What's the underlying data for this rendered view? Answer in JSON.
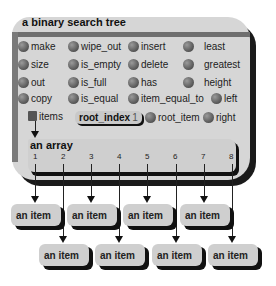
{
  "object": {
    "title": "a binary search tree",
    "features": [
      {
        "label": "make",
        "col": 0,
        "row": 0
      },
      {
        "label": "wipe_out",
        "col": 1,
        "row": 0
      },
      {
        "label": "insert",
        "col": 2,
        "row": 0
      },
      {
        "label": "least",
        "col": 3,
        "row": 0
      },
      {
        "label": "size",
        "col": 0,
        "row": 1
      },
      {
        "label": "is_empty",
        "col": 1,
        "row": 1
      },
      {
        "label": "delete",
        "col": 2,
        "row": 1
      },
      {
        "label": "greatest",
        "col": 3,
        "row": 1
      },
      {
        "label": "out",
        "col": 0,
        "row": 2
      },
      {
        "label": "is_full",
        "col": 1,
        "row": 2
      },
      {
        "label": "has",
        "col": 2,
        "row": 2
      },
      {
        "label": "height",
        "col": 3,
        "row": 2
      },
      {
        "label": "copy",
        "col": 0,
        "row": 3
      },
      {
        "label": "is_equal",
        "col": 1,
        "row": 3
      },
      {
        "label": "item_equal_to",
        "col": 2,
        "row": 3
      },
      {
        "label": "left",
        "col": 3,
        "row": 3
      },
      {
        "label": "root_item",
        "col": 2,
        "row": 4
      },
      {
        "label": "right",
        "col": 3,
        "row": 4
      }
    ],
    "items_label": "items",
    "root_index": {
      "label": "root_index",
      "value": "1"
    }
  },
  "array": {
    "title": "an array",
    "indices": [
      "1",
      "2",
      "3",
      "4",
      "5",
      "6",
      "7",
      "8"
    ]
  },
  "items": {
    "label": "an item",
    "count": 8
  }
}
